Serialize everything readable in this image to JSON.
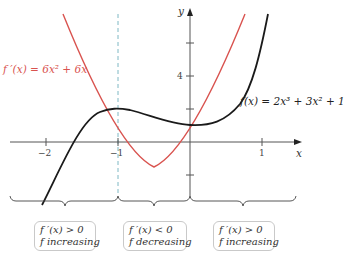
{
  "diagram": {
    "axes": {
      "x_label": "x",
      "y_label": "y",
      "x_ticks": [
        -2,
        -1,
        1
      ],
      "x_tick_labels": [
        "−2",
        "−1",
        "1"
      ],
      "y_ticks": [
        -2,
        2,
        4,
        6
      ],
      "y_tick_labels": [
        "4"
      ]
    },
    "curves": {
      "f": {
        "label": "f(x) = 2x³ + 3x² + 1",
        "color": "#1a1a1a"
      },
      "f_prime": {
        "label": "f ′(x) = 6x² + 6x",
        "color": "#d9534f"
      }
    },
    "dashed_line": {
      "x": -1,
      "color": "#7fb8c4"
    },
    "intervals": [
      {
        "line1": "f ′(x) > 0",
        "line2": "f increasing"
      },
      {
        "line1": "f ′(x) < 0",
        "line2": "f decreasing"
      },
      {
        "line1": "f ′(x) > 0",
        "line2": "f increasing"
      }
    ]
  }
}
